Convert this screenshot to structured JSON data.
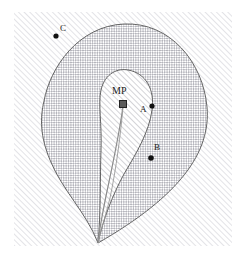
{
  "figure": {
    "title": "",
    "frame": {
      "x": 14,
      "y": 12,
      "width": 218,
      "height": 234,
      "fill_pattern": "diagonal-hatch"
    },
    "regions": [
      {
        "name": "outer-region",
        "fill_pattern": "crosshatch",
        "stroke": "#555555"
      },
      {
        "name": "inner-region",
        "fill_pattern": "diagonal-hatch",
        "stroke": "#555555"
      }
    ],
    "path_curve": {
      "name": "mp-trajectory",
      "stroke": "#8c8c8c"
    },
    "markers": [
      {
        "id": "MP",
        "label": "MP",
        "shape": "square",
        "x": 123,
        "y": 104,
        "label_x": 113,
        "label_y": 90,
        "color": "#4a4a4a"
      },
      {
        "id": "A",
        "label": "A",
        "shape": "dot",
        "x": 152,
        "y": 106,
        "label_x": 140,
        "label_y": 106,
        "color": "#111111"
      },
      {
        "id": "B",
        "label": "B",
        "shape": "dot",
        "x": 151,
        "y": 158,
        "label_x": 154,
        "label_y": 144,
        "color": "#111111"
      },
      {
        "id": "C",
        "label": "C",
        "shape": "dot",
        "x": 56,
        "y": 36,
        "label_x": 60,
        "label_y": 23,
        "color": "#111111"
      }
    ],
    "colors": {
      "frame_hatch": "#d8d8dd",
      "outer_hatch": "#b9b9bf",
      "inner_hatch": "#cfcfd4",
      "outline": "#555555",
      "curve": "#8c8c8c",
      "marker": "#111111",
      "background": "#ffffff"
    }
  }
}
